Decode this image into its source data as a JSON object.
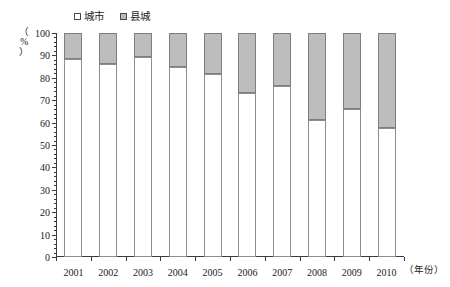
{
  "chart_data": {
    "type": "bar",
    "subtype": "stacked-percentage",
    "title": "",
    "xlabel": "（年份）",
    "ylabel": "（%）",
    "categories": [
      "2001",
      "2002",
      "2003",
      "2004",
      "2005",
      "2006",
      "2007",
      "2008",
      "2009",
      "2010"
    ],
    "series": [
      {
        "name": "城市",
        "swatch": "white",
        "color": "#ffffff",
        "values": [
          88.5,
          86.0,
          89.5,
          85.0,
          81.5,
          73.0,
          76.5,
          61.0,
          66.0,
          57.5
        ]
      },
      {
        "name": "县城",
        "swatch": "gray",
        "color": "#bdbdbd",
        "values": [
          11.5,
          14.0,
          10.5,
          15.0,
          18.5,
          27.0,
          23.5,
          39.0,
          34.0,
          42.5
        ]
      }
    ],
    "ylim": [
      0,
      100
    ],
    "y_ticks": [
      0,
      10,
      20,
      30,
      40,
      50,
      60,
      70,
      80,
      90,
      100
    ],
    "y_minor_step": 2,
    "grid": false,
    "legend_position": "top-left"
  },
  "legend": {
    "entries": [
      {
        "label": "城市"
      },
      {
        "label": "县城"
      }
    ]
  },
  "axes": {
    "y_unit_label": "（%）",
    "x_unit_label": "（年份）"
  }
}
